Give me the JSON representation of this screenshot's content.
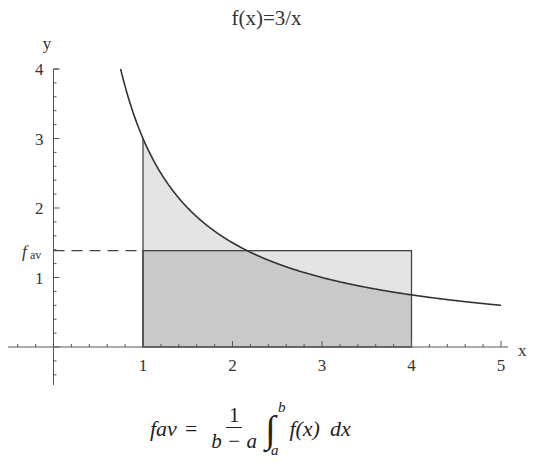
{
  "chart_data": {
    "type": "area",
    "title": "f(x)=3/x",
    "xlabel": "x",
    "ylabel": "y",
    "xlim": [
      -0.1,
      5.2
    ],
    "ylim": [
      -0.4,
      4.1
    ],
    "xticks": [
      1,
      2,
      3,
      4,
      5
    ],
    "yticks": [
      1,
      2,
      3,
      4
    ],
    "function": "3/x",
    "curve_domain": [
      0.75,
      5
    ],
    "interval": {
      "a": 1,
      "b": 4
    },
    "f_av": 1.386,
    "f_av_label": "fav",
    "samples": {
      "x": [
        0.75,
        1,
        1.5,
        2,
        2.5,
        3,
        3.5,
        4,
        4.5,
        5
      ],
      "y": [
        4.0,
        3.0,
        2.0,
        1.5,
        1.2,
        1.0,
        0.857,
        0.75,
        0.667,
        0.6
      ]
    },
    "annotations": [
      "dashed line from y-axis to x=1 at y=f_av",
      "rectangle from x=1 to x=4 with height f_av",
      "shaded area under curve from x=1 to x=4"
    ],
    "formula": "fav = 1/(b-a) ∫_a^b f(x) dx",
    "grid": false
  },
  "labels": {
    "title": "f(x)=3/x",
    "x_axis": "x",
    "y_axis": "y",
    "fav_f": "f",
    "fav_sub": "av",
    "xticks": [
      "1",
      "2",
      "3",
      "4",
      "5"
    ],
    "yticks": [
      "1",
      "2",
      "3",
      "4"
    ]
  },
  "formula": {
    "lhs": "fav",
    "eq": "=",
    "num": "1",
    "den": "b − a",
    "int": "∫",
    "upper": "b",
    "lower": "a",
    "integrand": "f(x)",
    "dx": "dx"
  },
  "colors": {
    "curve": "#333333",
    "fill_light": "#e4e4e4",
    "fill_dark": "#c9c9c9",
    "axis": "#555555"
  }
}
